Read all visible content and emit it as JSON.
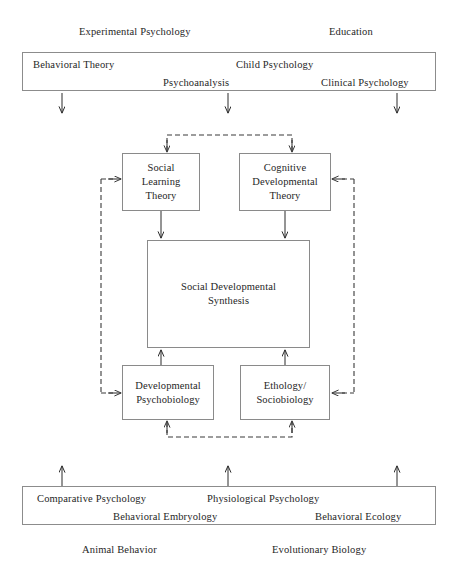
{
  "figure": {
    "background_color": "#ffffff",
    "box_border_color": "#8a8a8a",
    "text_color": "#262626",
    "solid_arrow_color": "#2b2b2b",
    "dashed_arrow_color": "#3a3a3a"
  },
  "top_captions": [
    {
      "text": "Experimental Psychology"
    },
    {
      "text": "Education"
    }
  ],
  "top_band": {
    "items": [
      {
        "text": "Behavioral Theory"
      },
      {
        "text": "Child Psychology"
      },
      {
        "text": "Psychoanalysis"
      },
      {
        "text": "Clinical Psychology"
      }
    ]
  },
  "core_nodes": [
    {
      "id": "social-learning-theory",
      "text": "Social\nLearning\nTheory"
    },
    {
      "id": "cognitive-developmental-theory",
      "text": "Cognitive\nDevelopmental\nTheory"
    },
    {
      "id": "social-developmental-synthesis",
      "text": "Social Developmental\nSynthesis"
    },
    {
      "id": "developmental-psychobiology",
      "text": "Developmental\nPsychobiology"
    },
    {
      "id": "ethology-sociobiology",
      "text": "Ethology/\nSociobiology"
    }
  ],
  "bottom_band": {
    "items": [
      {
        "text": "Comparative Psychology"
      },
      {
        "text": "Physiological Psychology"
      },
      {
        "text": "Behavioral Embryology"
      },
      {
        "text": "Behavioral Ecology"
      }
    ]
  },
  "bottom_captions": [
    {
      "text": "Animal Behavior"
    },
    {
      "text": "Evolutionary Biology"
    }
  ],
  "connectors": {
    "solid_down_from_top_band": 3,
    "solid_up_into_bottom_band": 3,
    "solid_into_synthesis_from_above": 2,
    "solid_into_synthesis_from_below": 2,
    "dashed_feedback_loops": 4
  }
}
